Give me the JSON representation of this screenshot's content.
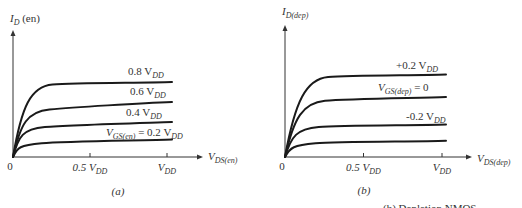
{
  "chart_data": [
    {
      "type": "line",
      "panel_label": "(a)",
      "ylabel": {
        "main": "I",
        "sub": "D",
        "suffix": " (en)"
      },
      "xlabel": {
        "main": "V",
        "sub": "DS(en)"
      },
      "origin_label": "0",
      "xticks": [
        {
          "value": 0.5,
          "main": "0.5 V",
          "sub": "DD"
        },
        {
          "value": 1.0,
          "main": "V",
          "sub": "DD"
        }
      ],
      "xlim": [
        0,
        1.4
      ],
      "ylim": [
        0,
        1.0
      ],
      "grid": false,
      "series": [
        {
          "name": "0.8 V_DD",
          "label_main": "0.8 V",
          "label_sub": "DD",
          "label_prefix": "",
          "knee": 0.14,
          "sat": 0.58,
          "end": 0.6
        },
        {
          "name": "0.6 V_DD",
          "label_main": "0.6 V",
          "label_sub": "DD",
          "label_prefix": "",
          "knee": 0.12,
          "sat": 0.38,
          "end": 0.44
        },
        {
          "name": "0.4 V_DD",
          "label_main": "0.4 V",
          "label_sub": "DD",
          "label_prefix": "",
          "knee": 0.09,
          "sat": 0.24,
          "end": 0.28
        },
        {
          "name": "V_GS(en) = 0.2 V_DD",
          "label_main": " = 0.2 V",
          "label_sub": "DD",
          "label_prefix": "V",
          "label_prefix_sub": "GS(en)",
          "knee": 0.07,
          "sat": 0.11,
          "end": 0.14
        }
      ]
    },
    {
      "type": "line",
      "panel_label": "(b)",
      "ylabel": {
        "main": "I",
        "sub": "D(dep)",
        "suffix": ""
      },
      "xlabel": {
        "main": "V",
        "sub": "DS(dep)"
      },
      "origin_label": "0",
      "xticks": [
        {
          "value": 0.5,
          "main": "0.5 V",
          "sub": "DD"
        },
        {
          "value": 1.0,
          "main": "V",
          "sub": "DD"
        }
      ],
      "xlim": [
        0,
        1.2
      ],
      "ylim": [
        0,
        1.0
      ],
      "grid": false,
      "series": [
        {
          "name": "+0.2 V_DD",
          "label_main": "+0.2 V",
          "label_sub": "DD",
          "label_prefix": "",
          "knee": 0.16,
          "sat": 0.64,
          "end": 0.66
        },
        {
          "name": "V_GS(dep) = 0",
          "label_main": " = 0",
          "label_sub": "",
          "label_prefix": "V",
          "label_prefix_sub": "GS(dep)",
          "knee": 0.14,
          "sat": 0.45,
          "end": 0.48
        },
        {
          "name": "-0.2 V_DD",
          "label_main": "-0.2 V",
          "label_sub": "DD",
          "label_prefix": "",
          "knee": 0.1,
          "sat": 0.24,
          "end": 0.26
        },
        {
          "name": "lowest curve",
          "label_main": "",
          "label_sub": "",
          "label_prefix": "",
          "knee": 0.08,
          "sat": 0.11,
          "end": 0.13
        }
      ]
    }
  ],
  "caption_fragment": "... (b) Depletion NMOS"
}
